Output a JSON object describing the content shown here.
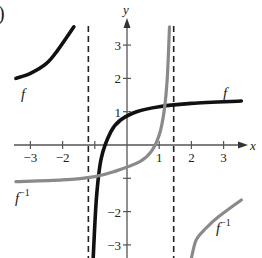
{
  "panel_label": ")",
  "chart_data": {
    "type": "line",
    "title": "",
    "xlabel": "x",
    "ylabel": "y",
    "xlim": [
      -3.5,
      3.6
    ],
    "ylim": [
      -3.4,
      3.6
    ],
    "grid": false,
    "x_ticks": [
      -3,
      -2,
      -1,
      1,
      2,
      3
    ],
    "x_tick_labels": [
      "−3",
      "−2",
      "",
      "1",
      "2",
      "3"
    ],
    "y_ticks": [
      -3,
      -2,
      -1,
      1,
      2,
      3
    ],
    "y_tick_labels": [
      "−3",
      "−2",
      "",
      "1",
      "2",
      "3"
    ],
    "asymptotes": [
      {
        "type": "vertical",
        "x": -1.2,
        "style": "dashed"
      },
      {
        "type": "vertical",
        "x": 1.45,
        "style": "dashed"
      }
    ],
    "series": [
      {
        "name": "f",
        "color": "#111111",
        "branches": [
          [
            [
              -3.45,
              2.0
            ],
            [
              -3.0,
              2.15
            ],
            [
              -2.5,
              2.45
            ],
            [
              -2.15,
              2.85
            ],
            [
              -1.65,
              3.55
            ]
          ],
          [
            [
              -1.05,
              -3.4
            ],
            [
              -0.95,
              -1.6
            ],
            [
              -0.8,
              -0.4
            ],
            [
              -0.5,
              0.4
            ],
            [
              -0.2,
              0.75
            ],
            [
              0.3,
              1.0
            ],
            [
              1.0,
              1.15
            ],
            [
              2.0,
              1.25
            ],
            [
              3.55,
              1.32
            ]
          ]
        ]
      },
      {
        "name": "f⁻¹",
        "color": "#8a8a8a",
        "branches": [
          [
            [
              -3.45,
              -1.1
            ],
            [
              -2.0,
              -1.05
            ],
            [
              -1.0,
              -0.95
            ],
            [
              -0.4,
              -0.8
            ],
            [
              0.4,
              -0.5
            ],
            [
              0.75,
              -0.2
            ],
            [
              1.0,
              0.3
            ],
            [
              1.15,
              1.0
            ],
            [
              1.25,
              2.0
            ],
            [
              1.32,
              3.55
            ]
          ],
          [
            [
              2.0,
              -3.4
            ],
            [
              2.15,
              -2.85
            ],
            [
              2.45,
              -2.5
            ],
            [
              2.85,
              -2.15
            ],
            [
              3.55,
              -1.65
            ]
          ]
        ]
      }
    ],
    "annotations": [
      {
        "text": "f",
        "x": -3.2,
        "y": 1.65
      },
      {
        "text": "f",
        "x": 2.9,
        "y": 1.6
      },
      {
        "text": "f⁻¹",
        "x": -3.3,
        "y": -1.55
      },
      {
        "text": "f⁻¹",
        "x": 2.9,
        "y": -2.1
      }
    ]
  },
  "labels": {
    "f_left": "f",
    "f_right": "f",
    "finv_left_base": "f",
    "finv_left_sup": "−1",
    "finv_right_base": "f",
    "finv_right_sup": "−1",
    "x_axis": "x",
    "y_axis": "y"
  }
}
